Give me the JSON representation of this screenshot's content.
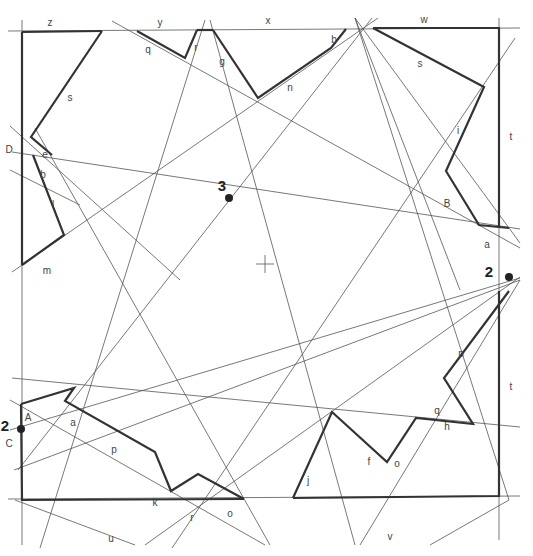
{
  "diagram": {
    "title": "",
    "colors": {
      "thin_line": "#555555",
      "thick_line": "#333333",
      "label": "#444444",
      "point": "#222222",
      "background": "#ffffff"
    },
    "center_mark": {
      "x": 265,
      "y": 264,
      "symbol": "+"
    },
    "points": [
      {
        "id": "p3",
        "label": "3",
        "x": 229,
        "y": 198,
        "lx": 222,
        "ly": 191
      },
      {
        "id": "p2-right",
        "label": "2",
        "x": 509,
        "y": 277,
        "lx": 489,
        "ly": 277
      },
      {
        "id": "p2-left",
        "label": "2",
        "x": 21,
        "y": 429,
        "lx": 5,
        "ly": 431
      }
    ],
    "edge_labels": [
      {
        "text": "z",
        "x": 50,
        "y": 26
      },
      {
        "text": "y",
        "x": 160,
        "y": 26
      },
      {
        "text": "x",
        "x": 268,
        "y": 24
      },
      {
        "text": "w",
        "x": 424,
        "y": 23
      },
      {
        "text": "t",
        "x": 511,
        "y": 140
      },
      {
        "text": "t",
        "x": 511,
        "y": 390
      },
      {
        "text": "D",
        "x": 9,
        "y": 153
      },
      {
        "text": "C",
        "x": 9,
        "y": 447
      },
      {
        "text": "u",
        "x": 111,
        "y": 542
      },
      {
        "text": "v",
        "x": 390,
        "y": 540
      }
    ],
    "segment_labels": [
      {
        "text": "s",
        "x": 70,
        "y": 101
      },
      {
        "text": "e",
        "x": 45,
        "y": 158
      },
      {
        "text": "b",
        "x": 43,
        "y": 178
      },
      {
        "text": "l",
        "x": 53,
        "y": 208
      },
      {
        "text": "m",
        "x": 47,
        "y": 274
      },
      {
        "text": "q",
        "x": 148,
        "y": 53
      },
      {
        "text": "r",
        "x": 196,
        "y": 51
      },
      {
        "text": "g",
        "x": 222,
        "y": 65
      },
      {
        "text": "n",
        "x": 290,
        "y": 91
      },
      {
        "text": "b",
        "x": 334,
        "y": 43
      },
      {
        "text": "s",
        "x": 420,
        "y": 67
      },
      {
        "text": "i",
        "x": 458,
        "y": 134
      },
      {
        "text": "B",
        "x": 447,
        "y": 207
      },
      {
        "text": "a",
        "x": 487,
        "y": 248
      },
      {
        "text": "p",
        "x": 461,
        "y": 357
      },
      {
        "text": "h",
        "x": 447,
        "y": 430
      },
      {
        "text": "q",
        "x": 437,
        "y": 414
      },
      {
        "text": "o",
        "x": 397,
        "y": 467
      },
      {
        "text": "f",
        "x": 369,
        "y": 465
      },
      {
        "text": "j",
        "x": 308,
        "y": 484
      },
      {
        "text": "A",
        "x": 28,
        "y": 421
      },
      {
        "text": "a",
        "x": 73,
        "y": 426
      },
      {
        "text": "p",
        "x": 114,
        "y": 453
      },
      {
        "text": "k",
        "x": 155,
        "y": 506
      },
      {
        "text": "r",
        "x": 192,
        "y": 521
      },
      {
        "text": "o",
        "x": 230,
        "y": 517
      }
    ],
    "thick_paths": [
      "22,32 102,31",
      "102,31 31,137 52,155",
      "33,155 64,235 22,265",
      "22,32 22,265",
      "137,31 185,58 197,30",
      "213,30 258,98 331,48 346,29",
      "197,30 213,30",
      "373,28 484,87 446,171 479,225 509,228",
      "373,28 499,28 499,228",
      "509,291 444,378 473,424 416,418 387,462 332,412 293,498",
      "499,291 499,496 293,498",
      "21,404 74,388 65,401 155,452 171,491 198,474 244,499",
      "21,404 22,500 244,499"
    ],
    "thin_lines": [
      "8,31 520,28",
      "8,499 520,496",
      "22,20 22,545",
      "499,18 499,540",
      "12,152 520,229",
      "12,378 520,427",
      "112,21 520,248",
      "10,400 265,545",
      "10,126 180,280",
      "35,128 270,545",
      "10,170 80,205",
      "12,272 378,18",
      "40,548 205,20",
      "18,470 372,18",
      "172,548 515,38",
      "145,545 520,277",
      "10,430 520,278",
      "14,470 520,280",
      "210,20 355,545",
      "355,18 460,290",
      "355,18 520,243",
      "355,18 509,500",
      "15,500 135,545",
      "360,545 520,280",
      "430,545 509,500"
    ]
  }
}
